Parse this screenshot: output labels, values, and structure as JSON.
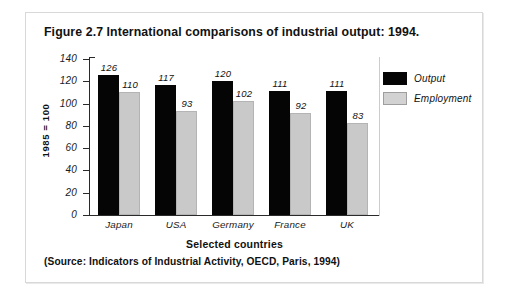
{
  "figure": {
    "title": "Figure 2.7  International comparisons of industrial output: 1994.",
    "source_note": "(Source: Indicators of Industrial Activity, OECD, Paris, 1994)"
  },
  "colors": {
    "output": "#050505",
    "employment": "#c9c9c9",
    "axis": "#2a2a2a",
    "frame": "#d8d8d8",
    "background": "#ffffff"
  },
  "chart_data": {
    "type": "bar",
    "title": "Figure 2.7  International comparisons of industrial output: 1994.",
    "xlabel": "Selected countries",
    "ylabel": "1985 = 100",
    "categories": [
      "Japan",
      "USA",
      "Germany",
      "France",
      "UK"
    ],
    "series": [
      {
        "name": "Output",
        "values": [
          126,
          117,
          120,
          111,
          111
        ],
        "color": "#050505"
      },
      {
        "name": "Employment",
        "values": [
          110,
          93,
          102,
          92,
          83
        ],
        "color": "#c9c9c9"
      }
    ],
    "ylim": [
      0,
      140
    ],
    "yticks": [
      0,
      20,
      40,
      60,
      80,
      100,
      120,
      140
    ],
    "ytick_labels": [
      "0",
      "20",
      "40",
      "60",
      "80",
      "100",
      "120",
      "140"
    ],
    "grid": false,
    "legend_position": "right",
    "data_labels": true
  }
}
